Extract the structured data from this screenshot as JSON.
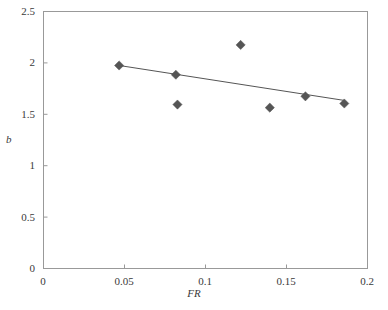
{
  "chart_data": {
    "type": "scatter",
    "title": "",
    "xlabel": "FR",
    "ylabel": "b",
    "xlim": [
      0,
      0.2
    ],
    "ylim": [
      0,
      2.5
    ],
    "xticks": [
      0,
      0.05,
      0.1,
      0.15,
      0.2
    ],
    "xtick_labels": [
      "0",
      "0.05",
      "0.1",
      "0.15",
      "0.2"
    ],
    "yticks": [
      0,
      0.5,
      1,
      1.5,
      2,
      2.5
    ],
    "ytick_labels": [
      "0",
      "0.5",
      "1",
      "1.5",
      "2",
      "2.5"
    ],
    "grid": false,
    "legend": null,
    "marker": "diamond",
    "marker_color": "#555555",
    "line_color": "#555555",
    "axis_color": "#999999",
    "points": [
      {
        "x": 0.047,
        "y": 1.97
      },
      {
        "x": 0.082,
        "y": 1.88
      },
      {
        "x": 0.083,
        "y": 1.59
      },
      {
        "x": 0.122,
        "y": 2.17
      },
      {
        "x": 0.14,
        "y": 1.56
      },
      {
        "x": 0.162,
        "y": 1.67
      },
      {
        "x": 0.186,
        "y": 1.6
      }
    ],
    "trendline": {
      "type": "linear",
      "x_start": 0.047,
      "y_start": 1.97,
      "x_end": 0.186,
      "y_end": 1.63
    }
  }
}
